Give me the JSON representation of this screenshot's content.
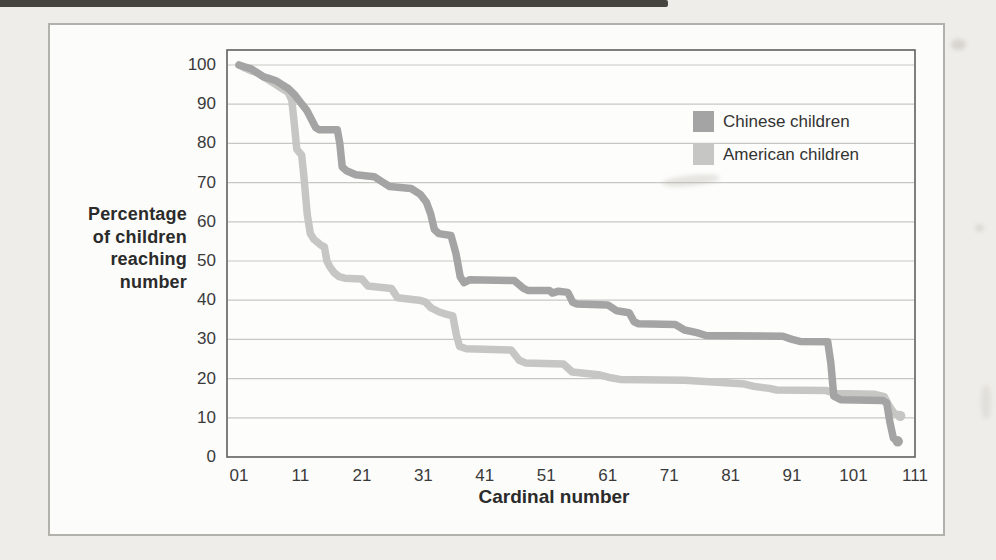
{
  "page": {
    "background": "#efede9"
  },
  "figure": {
    "border_color": "#b3b1ac",
    "background": "#fcfcfa",
    "plot_background": "#fdfdfb",
    "plot_border_color": "#5f5f5c",
    "gridline_color": "#c7c7c3"
  },
  "chart": {
    "y_axis_title": "Percentage\nof children\nreaching\nnumber",
    "x_axis_title": "Cardinal number",
    "series_meta": [
      {
        "label": "Chinese children",
        "color": "#a4a4a4"
      },
      {
        "label": "American children",
        "color": "#c6c6c4"
      }
    ]
  },
  "chart_data": {
    "type": "line",
    "title": "",
    "xlabel": "Cardinal number",
    "ylabel": "Percentage of children reaching number",
    "xlim": [
      -1,
      111
    ],
    "ylim": [
      0,
      100
    ],
    "grid": "horizontal",
    "legend_position": "inside top-right",
    "x_ticks": [
      {
        "value": 1,
        "label": "01"
      },
      {
        "value": 11,
        "label": "11"
      },
      {
        "value": 21,
        "label": "21"
      },
      {
        "value": 31,
        "label": "31"
      },
      {
        "value": 41,
        "label": "41"
      },
      {
        "value": 51,
        "label": "51"
      },
      {
        "value": 61,
        "label": "61"
      },
      {
        "value": 71,
        "label": "71"
      },
      {
        "value": 81,
        "label": "81"
      },
      {
        "value": 91,
        "label": "91"
      },
      {
        "value": 101,
        "label": "101"
      },
      {
        "value": 111,
        "label": "111"
      }
    ],
    "y_ticks": [
      {
        "value": 100,
        "label": "100"
      },
      {
        "value": 90,
        "label": "90"
      },
      {
        "value": 80,
        "label": "80"
      },
      {
        "value": 70,
        "label": "70"
      },
      {
        "value": 60,
        "label": "60"
      },
      {
        "value": 50,
        "label": "50"
      },
      {
        "value": 40,
        "label": "40"
      },
      {
        "value": 30,
        "label": "30"
      },
      {
        "value": 20,
        "label": "20"
      },
      {
        "value": 10,
        "label": "10"
      },
      {
        "value": 0,
        "label": "0"
      }
    ],
    "series": [
      {
        "name": "American children",
        "color": "#c6c6c4",
        "line_width": 7.5,
        "points": [
          [
            1,
            100
          ],
          [
            2,
            99.2
          ],
          [
            3,
            98.5
          ],
          [
            4,
            98
          ],
          [
            5,
            97
          ],
          [
            6,
            96
          ],
          [
            7,
            95
          ],
          [
            8,
            94
          ],
          [
            9,
            93
          ],
          [
            9.6,
            91
          ],
          [
            10,
            85
          ],
          [
            10.4,
            78.5
          ],
          [
            11.2,
            77
          ],
          [
            11.6,
            71
          ],
          [
            12.1,
            62
          ],
          [
            12.6,
            57
          ],
          [
            13.2,
            55.5
          ],
          [
            14.4,
            54
          ],
          [
            14.9,
            53.6
          ],
          [
            15.3,
            50
          ],
          [
            15.8,
            48.5
          ],
          [
            16.5,
            47
          ],
          [
            17.3,
            46
          ],
          [
            18.2,
            45.6
          ],
          [
            21,
            45.4
          ],
          [
            22,
            43.6
          ],
          [
            25.8,
            43
          ],
          [
            26.8,
            40.6
          ],
          [
            30.3,
            40
          ],
          [
            31.3,
            39.6
          ],
          [
            32.3,
            38
          ],
          [
            33.6,
            37
          ],
          [
            34.8,
            36.4
          ],
          [
            35.8,
            36
          ],
          [
            36.4,
            31
          ],
          [
            36.9,
            28.2
          ],
          [
            38,
            27.6
          ],
          [
            45.3,
            27.3
          ],
          [
            46.6,
            24.7
          ],
          [
            47.6,
            24
          ],
          [
            53.8,
            23.7
          ],
          [
            55.2,
            21.7
          ],
          [
            59.5,
            21
          ],
          [
            61.5,
            20.2
          ],
          [
            63,
            19.8
          ],
          [
            73.5,
            19.6
          ],
          [
            79.5,
            19
          ],
          [
            83.3,
            18.6
          ],
          [
            84.8,
            18
          ],
          [
            87.3,
            17.5
          ],
          [
            88.5,
            17.1
          ],
          [
            96.5,
            17
          ],
          [
            98,
            16.2
          ],
          [
            104.5,
            16
          ],
          [
            106,
            15.4
          ],
          [
            106.8,
            13
          ],
          [
            107.6,
            11.2
          ],
          [
            108.6,
            10.5
          ]
        ]
      },
      {
        "name": "Chinese children",
        "color": "#a4a4a4",
        "line_width": 7.5,
        "points": [
          [
            1,
            100
          ],
          [
            2,
            99.5
          ],
          [
            3,
            99
          ],
          [
            4,
            98
          ],
          [
            5,
            97
          ],
          [
            6,
            96.5
          ],
          [
            7,
            96
          ],
          [
            8,
            95
          ],
          [
            9,
            94
          ],
          [
            10,
            92.5
          ],
          [
            11,
            90.5
          ],
          [
            12,
            88.5
          ],
          [
            13,
            85.5
          ],
          [
            13.5,
            84
          ],
          [
            14,
            83.5
          ],
          [
            17,
            83.5
          ],
          [
            17.4,
            80
          ],
          [
            17.8,
            74
          ],
          [
            18.5,
            73
          ],
          [
            20,
            72
          ],
          [
            23,
            71.5
          ],
          [
            24.5,
            70
          ],
          [
            25.5,
            69
          ],
          [
            29,
            68.5
          ],
          [
            30.5,
            67
          ],
          [
            31.5,
            65
          ],
          [
            32.2,
            62
          ],
          [
            32.8,
            58
          ],
          [
            33.5,
            57
          ],
          [
            35.5,
            56.5
          ],
          [
            36.3,
            52
          ],
          [
            37,
            46
          ],
          [
            37.6,
            44.5
          ],
          [
            38.5,
            45.2
          ],
          [
            45.8,
            45
          ],
          [
            47.3,
            43
          ],
          [
            48,
            42.5
          ],
          [
            51.5,
            42.5
          ],
          [
            52,
            41.8
          ],
          [
            53,
            42.3
          ],
          [
            54.5,
            42
          ],
          [
            55.3,
            39.5
          ],
          [
            56,
            39
          ],
          [
            61,
            38.8
          ],
          [
            62.5,
            37.3
          ],
          [
            64.5,
            36.8
          ],
          [
            65.3,
            34.5
          ],
          [
            66,
            34
          ],
          [
            72,
            33.8
          ],
          [
            73.5,
            32.4
          ],
          [
            75.5,
            31.7
          ],
          [
            77,
            31
          ],
          [
            89.5,
            30.8
          ],
          [
            91,
            30
          ],
          [
            92.3,
            29.5
          ],
          [
            96.8,
            29.4
          ],
          [
            97.3,
            24
          ],
          [
            97.8,
            15.5
          ],
          [
            99,
            14.6
          ],
          [
            105.8,
            14.4
          ],
          [
            106.4,
            13.8
          ],
          [
            106.9,
            9
          ],
          [
            107.5,
            4.8
          ],
          [
            108.2,
            4
          ]
        ]
      }
    ]
  }
}
